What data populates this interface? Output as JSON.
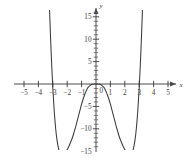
{
  "figure": {
    "background_color": "#ffffff",
    "curve_color": "#3a3a3a",
    "axis_color": "#4a4a4a",
    "label_color": "#3c3c3c",
    "width": 192,
    "height": 158
  },
  "axes": {
    "x_axis_name": "x",
    "y_axis_name": "y",
    "x_labels": [
      "−5",
      "−4",
      "−3",
      "−2",
      "−1",
      "1",
      "2",
      "3",
      "4",
      "5"
    ],
    "x_label_values": [
      -5,
      -4,
      -3,
      -2,
      -1,
      1,
      2,
      3,
      4,
      5
    ],
    "y_labels": [
      "15",
      "10",
      "5",
      "−5",
      "−10",
      "−15"
    ],
    "y_label_values": [
      15,
      10,
      5,
      -5,
      -10,
      -15
    ],
    "origin_label": "0"
  },
  "chart_data": {
    "type": "line",
    "title": "",
    "subtitle": "",
    "xlabel": "x",
    "ylabel": "y",
    "xlim": [
      -5.6,
      5.6
    ],
    "ylim": [
      -16.5,
      16.5
    ],
    "xticks": [
      -5,
      -4,
      -3,
      -2,
      -1,
      0,
      1,
      2,
      3,
      4,
      5
    ],
    "yticks": [
      -15,
      -10,
      -5,
      0,
      5,
      10,
      15
    ],
    "x_minor_tick_step": 1,
    "y_minor_tick_step": 1,
    "grid": false,
    "legend": null,
    "legend_position": "none",
    "annotations": [],
    "series": [
      {
        "name": "polynomial",
        "description": "Even degree-6 polynomial, W-shaped: local maximum at origin (0,0) touching the x-axis, two symmetric minima near x = ±2.0 at y ≈ −14.6, x-intercepts at x = 0 (double) and x ≈ ±2.88, branches rising off the top of the plot near x ≈ ±3.25",
        "x": [
          -3.28,
          -3.2,
          -3.1,
          -3.0,
          -2.9,
          -2.8,
          -2.7,
          -2.6,
          -2.5,
          -2.4,
          -2.3,
          -2.2,
          -2.1,
          -2.0,
          -1.9,
          -1.8,
          -1.7,
          -1.6,
          -1.5,
          -1.4,
          -1.3,
          -1.2,
          -1.1,
          -1.0,
          -0.9,
          -0.8,
          -0.7,
          -0.6,
          -0.5,
          -0.4,
          -0.3,
          -0.2,
          -0.1,
          0.0,
          0.1,
          0.2,
          0.3,
          0.4,
          0.5,
          0.6,
          0.7,
          0.8,
          0.9,
          1.0,
          1.1,
          1.2,
          1.3,
          1.4,
          1.5,
          1.6,
          1.7,
          1.8,
          1.9,
          2.0,
          2.1,
          2.2,
          2.3,
          2.4,
          2.5,
          2.6,
          2.7,
          2.8,
          2.9,
          3.0,
          3.1,
          3.2,
          3.28
        ],
        "y": [
          21.9,
          14.2,
          5.9,
          -0.9,
          -6.1,
          -10.0,
          -12.7,
          -14.4,
          -15.4,
          -15.8,
          -15.8,
          -15.5,
          -15.1,
          -14.6,
          -14.0,
          -13.3,
          -12.5,
          -11.6,
          -10.5,
          -9.4,
          -8.2,
          -6.9,
          -5.7,
          -4.5,
          -3.4,
          -2.5,
          -1.7,
          -1.0,
          -0.6,
          -0.3,
          -0.1,
          -0.04,
          -0.01,
          0.0,
          -0.01,
          -0.04,
          -0.1,
          -0.3,
          -0.6,
          -1.0,
          -1.7,
          -2.5,
          -3.4,
          -4.5,
          -5.7,
          -6.9,
          -8.2,
          -9.4,
          -10.5,
          -11.6,
          -12.5,
          -13.3,
          -14.0,
          -14.6,
          -15.1,
          -15.5,
          -15.8,
          -15.8,
          -15.4,
          -14.4,
          -12.7,
          -10.0,
          -6.1,
          -0.9,
          5.9,
          14.2,
          21.9
        ],
        "color": "#3a3a3a",
        "x_intercepts": [
          -2.88,
          0,
          2.88
        ],
        "local_maxima": [
          {
            "x": 0,
            "y": 0
          }
        ],
        "local_minima": [
          {
            "x": -2.0,
            "y": -14.6
          },
          {
            "x": 2.0,
            "y": -14.6
          }
        ]
      }
    ]
  }
}
